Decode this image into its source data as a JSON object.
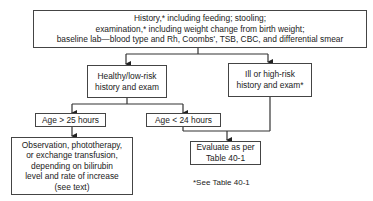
{
  "diagram": {
    "type": "flowchart",
    "nodes": {
      "top": {
        "lines": [
          "History,* including feeding; stooling;",
          "examination,* including weight change from birth weight;",
          "baseline lab—blood type and Rh, Coombs', TSB, CBC, and differential smear"
        ]
      },
      "healthy": {
        "lines": [
          "Healthy/low-risk",
          "history and exam"
        ]
      },
      "ill": {
        "lines": [
          "Ill or high-risk",
          "history and exam*"
        ]
      },
      "age_over": {
        "lines": [
          "Age > 25 hours"
        ]
      },
      "age_under": {
        "lines": [
          "Age < 24 hours"
        ]
      },
      "observation": {
        "lines": [
          "Observation, phototherapy,",
          "or exchange transfusion,",
          "depending on bilirubin",
          "level and rate of increase",
          "(see text)"
        ]
      },
      "evaluate": {
        "lines": [
          "Evaluate as per",
          "Table 40-1"
        ]
      }
    },
    "edges": [
      {
        "from": "top",
        "to": "healthy"
      },
      {
        "from": "top",
        "to": "ill"
      },
      {
        "from": "healthy",
        "to": "age_over"
      },
      {
        "from": "healthy",
        "to": "age_under"
      },
      {
        "from": "age_over",
        "to": "observation"
      },
      {
        "from": "age_under",
        "to": "evaluate"
      },
      {
        "from": "ill",
        "to": "evaluate"
      }
    ],
    "footnote": "*See Table 40-1",
    "colors": {
      "line": "#333333",
      "box_border": "#444444",
      "background": "#ffffff"
    }
  }
}
